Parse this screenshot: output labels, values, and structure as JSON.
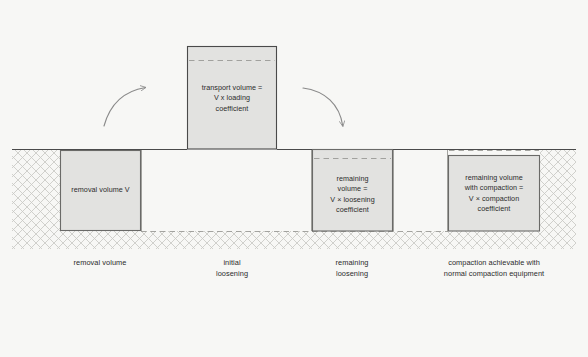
{
  "figure": {
    "background_color": "#f7f7f5",
    "ink_color": "#4a4a4a",
    "box_fill_color": "#e2e2e0",
    "text_color": "#2b2b2b",
    "ground_line_label": "ground level"
  },
  "boxes": [
    {
      "id": "removal-volume",
      "label": "removal volume V",
      "x": 60,
      "y": 150,
      "w": 81,
      "h": 81,
      "position": "below-ground",
      "dashed_top": false
    },
    {
      "id": "transport-volume",
      "label": "transport volume =\nV x loading\ncoefficient",
      "x": 187,
      "y": 46,
      "w": 90,
      "h": 103,
      "position": "above-ground",
      "dashed_top": true
    },
    {
      "id": "remaining-volume",
      "label": "remaining\nvolume =\nV × loosening\ncoefficient",
      "x": 312,
      "y": 149,
      "w": 81,
      "h": 82,
      "position": "below-ground",
      "dashed_top": true
    },
    {
      "id": "remaining-volume-compacted",
      "label": "remaining volume\nwith compaction =\nV × compaction\ncoefficient",
      "x": 448,
      "y": 155,
      "w": 92,
      "h": 76,
      "position": "below-ground",
      "dashed_top": true
    }
  ],
  "captions": [
    {
      "id": "caption-removal",
      "text": "removal volume",
      "cx": 100,
      "y": 258
    },
    {
      "id": "caption-initial-loosening",
      "text": "initial\nloosening",
      "cx": 232,
      "y": 258
    },
    {
      "id": "caption-remaining-loosening",
      "text": "remaining\nloosening",
      "cx": 352,
      "y": 258
    },
    {
      "id": "caption-compaction",
      "text": "compaction achievable with\nnormal compaction equipment",
      "cx": 494,
      "y": 258
    }
  ],
  "arrows": [
    {
      "id": "arrow-excavate-to-transport",
      "direction": "up-right",
      "from": [
        104,
        124
      ],
      "to": [
        146,
        88
      ]
    },
    {
      "id": "arrow-transport-to-fill",
      "direction": "down-right",
      "from": [
        303,
        88
      ],
      "to": [
        343,
        128
      ]
    }
  ],
  "ground": {
    "y": 149,
    "x_start": 12,
    "x_end": 576
  },
  "reference_lines": [
    {
      "id": "original-depth-line",
      "y": 231,
      "x_start": 141,
      "x_end": 448,
      "style": "dashed"
    }
  ]
}
